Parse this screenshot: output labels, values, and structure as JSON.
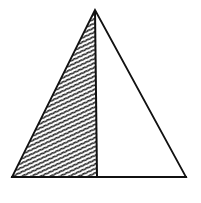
{
  "diagram": {
    "type": "triangle-with-shaded-half",
    "colors": {
      "background": "#ffffff",
      "stroke": "#111111",
      "hatch": "#222222",
      "unshaded_fill": "#ffffff"
    },
    "points": {
      "apex": [
        95,
        10
      ],
      "bottom_left": [
        12,
        177
      ],
      "bottom_right": [
        186,
        177
      ],
      "divider_bottom": [
        97,
        177
      ]
    },
    "regions": [
      {
        "name": "left-shaded-region",
        "shaded": true
      },
      {
        "name": "right-unshaded-region",
        "shaded": false
      }
    ]
  }
}
